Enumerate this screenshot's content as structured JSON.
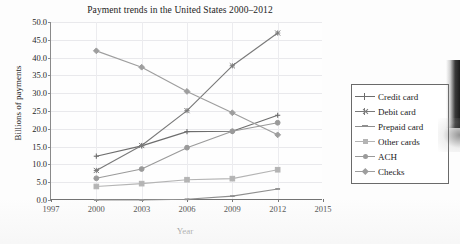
{
  "chart_data": {
    "type": "line",
    "title": "Payment trends in the United States 2000–2012",
    "xlabel": "Year",
    "ylabel": "Billions of payments",
    "x": [
      2000,
      2003,
      2006,
      2009,
      2012
    ],
    "xlim": [
      1997,
      2015
    ],
    "ylim": [
      0.0,
      50.0
    ],
    "xticks": [
      "1997",
      "2000",
      "2003",
      "2006",
      "2009",
      "2012",
      "2015"
    ],
    "yticks": [
      "0.0",
      "5.0",
      "10.0",
      "15.0",
      "20.0",
      "25.0",
      "30.0",
      "35.0",
      "40.0",
      "45.0",
      "50.0"
    ],
    "grid": true,
    "legend_position": "right",
    "series": [
      {
        "name": "Credit card",
        "marker": "plus",
        "color": "#6d6d6d",
        "values": [
          12.3,
          15.2,
          19.2,
          19.3,
          23.8
        ]
      },
      {
        "name": "Debit card",
        "marker": "cross",
        "color": "#7a7a7a",
        "values": [
          8.3,
          15.3,
          25.1,
          37.7,
          46.9
        ]
      },
      {
        "name": "Prepaid card",
        "marker": "dash",
        "color": "#8f8f8f",
        "values": [
          0.0,
          0.0,
          0.2,
          1.1,
          3.1
        ]
      },
      {
        "name": "Other cards",
        "marker": "square",
        "color": "#b4b4b4",
        "values": [
          3.8,
          4.6,
          5.7,
          6.0,
          8.5
        ]
      },
      {
        "name": "ACH",
        "marker": "circle",
        "color": "#9a9a9a",
        "values": [
          6.1,
          8.7,
          14.7,
          19.3,
          21.7
        ]
      },
      {
        "name": "Checks",
        "marker": "diamond",
        "color": "#9e9e9e",
        "values": [
          41.9,
          37.3,
          30.5,
          24.5,
          18.3
        ]
      }
    ]
  }
}
